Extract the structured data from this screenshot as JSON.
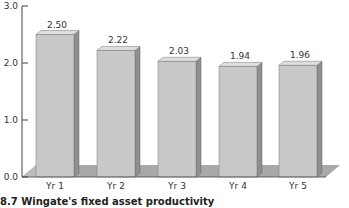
{
  "caption": "8.7 Wingate's fixed asset productivity",
  "colors": {
    "bar_front": "#c8c8c8",
    "bar_side": "#8f8f8f",
    "bar_top": "#dedede",
    "floor": "#a9a9a9",
    "axis": "#444444"
  },
  "chart_data": {
    "type": "bar",
    "title": "",
    "caption": "8.7 Wingate's fixed asset productivity",
    "categories": [
      "Yr 1",
      "Yr 2",
      "Yr 3",
      "Yr 4",
      "Yr 5"
    ],
    "values": [
      2.5,
      2.22,
      2.03,
      1.94,
      1.96
    ],
    "data_labels": [
      "2.50",
      "2.22",
      "2.03",
      "1.94",
      "1.96"
    ],
    "xlabel": "",
    "ylabel": "",
    "ylim": [
      0,
      3.0
    ],
    "yticks": [
      "0.0",
      "1.0",
      "2.0",
      "3.0"
    ],
    "grid": false,
    "legend": null,
    "style": "3d-bar"
  }
}
